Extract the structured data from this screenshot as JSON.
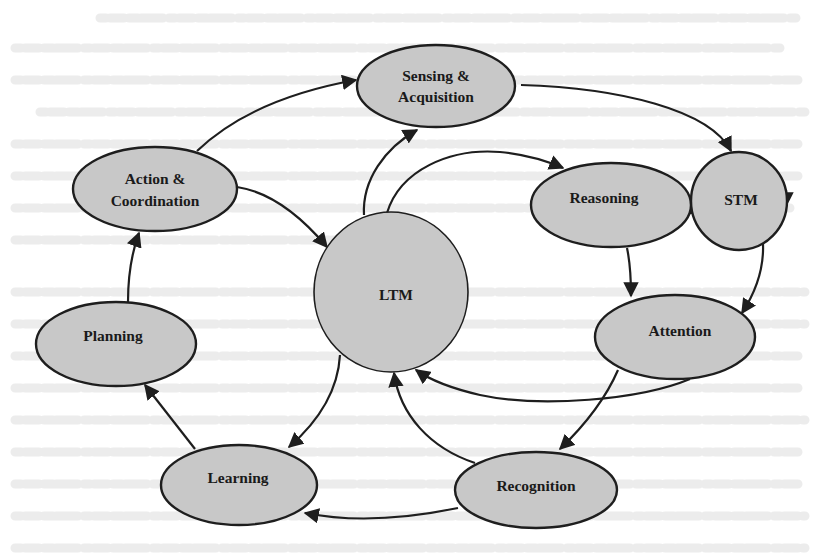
{
  "diagram": {
    "title": "",
    "nodes": [
      {
        "id": "sensing",
        "shape": "ellipse",
        "lines": [
          "Sensing &",
          "Acquisition"
        ]
      },
      {
        "id": "action",
        "shape": "ellipse",
        "lines": [
          "Action &",
          "Coordination"
        ]
      },
      {
        "id": "reasoning",
        "shape": "ellipse",
        "lines": [
          "Reasoning"
        ]
      },
      {
        "id": "stm",
        "shape": "circle",
        "lines": [
          "STM"
        ]
      },
      {
        "id": "ltm",
        "shape": "circle",
        "lines": [
          "LTM"
        ]
      },
      {
        "id": "planning",
        "shape": "ellipse",
        "lines": [
          "Planning"
        ]
      },
      {
        "id": "attention",
        "shape": "ellipse",
        "lines": [
          "Attention"
        ]
      },
      {
        "id": "learning",
        "shape": "ellipse",
        "lines": [
          "Learning"
        ]
      },
      {
        "id": "recognition",
        "shape": "ellipse",
        "lines": [
          "Recognition"
        ]
      }
    ],
    "edges": [
      {
        "from": "Action & Coordination",
        "to": "Sensing & Acquisition"
      },
      {
        "from": "Sensing & Acquisition",
        "to": "STM"
      },
      {
        "from": "Action & Coordination",
        "to": "LTM"
      },
      {
        "from": "LTM",
        "to": "Sensing & Acquisition"
      },
      {
        "from": "LTM",
        "to": "Reasoning"
      },
      {
        "from": "Reasoning",
        "to": "STM"
      },
      {
        "from": "STM",
        "to": "STM (self-loop)"
      },
      {
        "from": "Reasoning",
        "to": "Attention"
      },
      {
        "from": "STM",
        "to": "Attention"
      },
      {
        "from": "Attention",
        "to": "LTM"
      },
      {
        "from": "Attention",
        "to": "Recognition"
      },
      {
        "from": "Recognition",
        "to": "LTM"
      },
      {
        "from": "Recognition",
        "to": "Learning"
      },
      {
        "from": "LTM",
        "to": "Learning"
      },
      {
        "from": "Learning",
        "to": "Planning"
      },
      {
        "from": "Planning",
        "to": "Action & Coordination"
      }
    ],
    "colors": {
      "node_fill": "#c8c8c8",
      "stroke": "#1e1e1e",
      "text": "#1a1a1a",
      "background": "#ffffff"
    }
  }
}
